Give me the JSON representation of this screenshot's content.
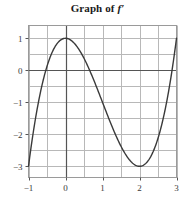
{
  "title": {
    "prefix": "Graph of ",
    "symbol": "f′",
    "full": "Graph of f′"
  },
  "chart_data": {
    "type": "line",
    "title": "Graph of f′",
    "xlabel": "",
    "ylabel": "",
    "xlim": [
      -1,
      3
    ],
    "ylim": [
      -3.35,
      1.4
    ],
    "grid": true,
    "grid_step_x": 0.5,
    "grid_step_y": 0.5,
    "legend": "none",
    "xticks": [
      -1,
      0,
      1,
      2,
      3
    ],
    "xtick_labels": [
      "−1",
      "0",
      "1",
      "2",
      "3"
    ],
    "yticks": [
      1,
      0,
      -1,
      -2,
      -3
    ],
    "ytick_labels": [
      "1",
      "0",
      "−1",
      "−2",
      "−3"
    ],
    "axis_color": "#555555",
    "grid_color": "#b8b8b8",
    "curve_color": "#3a3a3a",
    "series": [
      {
        "name": "f′",
        "x": [
          -1.0,
          -0.9,
          -0.8,
          -0.7,
          -0.6,
          -0.5,
          -0.4,
          -0.3,
          -0.2,
          -0.1,
          0.0,
          0.1,
          0.2,
          0.3,
          0.4,
          0.5,
          0.6,
          0.7,
          0.8,
          0.9,
          1.0,
          1.1,
          1.2,
          1.3,
          1.4,
          1.5,
          1.6,
          1.7,
          1.8,
          1.9,
          2.0,
          2.1,
          2.2,
          2.3,
          2.4,
          2.5,
          2.6,
          2.7,
          2.8,
          2.9,
          3.0
        ],
        "y": [
          -3.0,
          -2.43,
          -1.92,
          -1.47,
          -1.08,
          -0.75,
          -0.48,
          -0.27,
          -0.12,
          -0.03,
          1.0,
          0.97,
          0.88,
          0.73,
          0.52,
          0.25,
          -0.08,
          -0.47,
          -0.92,
          -1.43,
          -2.0,
          -2.33,
          -2.6,
          -2.8,
          -2.93,
          -3.0,
          -3.0,
          -2.93,
          -2.8,
          -2.6,
          -3.0,
          -2.67,
          -2.28,
          -1.83,
          -1.32,
          -0.75,
          -0.12,
          0.57,
          1.32,
          2.13,
          1.0
        ]
      }
    ],
    "key_points": [
      {
        "label": "left endpoint",
        "x": -1,
        "y": -3
      },
      {
        "label": "local maximum",
        "x": 0,
        "y": 1
      },
      {
        "label": "local minimum",
        "x": 2,
        "y": -3
      },
      {
        "label": "right endpoint",
        "x": 3,
        "y": 1
      }
    ],
    "zero_crossings": [
      -0.5,
      0.58,
      2.75
    ]
  }
}
